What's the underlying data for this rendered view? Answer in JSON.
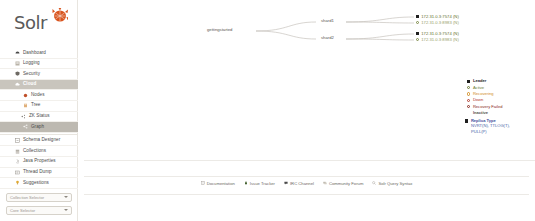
{
  "app": {
    "name": "Solr",
    "logo_text": "Solr",
    "logo_icon": "solr-sunburst-icon"
  },
  "sidebar": {
    "items": [
      {
        "label": "Dashboard",
        "icon": "dashboard-icon",
        "state": "normal",
        "level": 0
      },
      {
        "label": "Logging",
        "icon": "logging-icon",
        "state": "normal",
        "level": 0
      },
      {
        "label": "Security",
        "icon": "security-icon",
        "state": "normal",
        "level": 0
      },
      {
        "label": "Cloud",
        "icon": "cloud-icon",
        "state": "active",
        "level": 0
      },
      {
        "label": "Nodes",
        "icon": "nodes-icon",
        "state": "normal",
        "level": 1
      },
      {
        "label": "Tree",
        "icon": "tree-icon",
        "state": "normal",
        "level": 1
      },
      {
        "label": "ZK Status",
        "icon": "zk-status-icon",
        "state": "normal",
        "level": 1
      },
      {
        "label": "Graph",
        "icon": "graph-icon",
        "state": "selected",
        "level": 1
      },
      {
        "label": "Schema Designer",
        "icon": "schema-designer-icon",
        "state": "normal",
        "level": 0
      },
      {
        "label": "Collections",
        "icon": "collections-icon",
        "state": "normal",
        "level": 0
      },
      {
        "label": "Java Properties",
        "icon": "java-properties-icon",
        "state": "normal",
        "level": 0
      },
      {
        "label": "Thread Dump",
        "icon": "thread-dump-icon",
        "state": "normal",
        "level": 0
      },
      {
        "label": "Suggestions",
        "icon": "suggestions-icon",
        "state": "normal",
        "level": 0
      }
    ],
    "selectors": [
      {
        "label": "Collection Selector",
        "icon": "chevron-down-icon"
      },
      {
        "label": "Core Selector",
        "icon": "chevron-down-icon"
      }
    ]
  },
  "graph": {
    "collection": "gettingstarted",
    "shards": [
      {
        "label": "shard1"
      },
      {
        "label": "shard2"
      }
    ],
    "replicas": [
      {
        "host": "172.31.0.3:7574 (N)",
        "marker": "leader",
        "color": "#5f6f2e",
        "shard": "shard1"
      },
      {
        "host": "172.31.0.3:8983 (N)",
        "marker": "active",
        "color": "#8b9657",
        "shard": "shard1"
      },
      {
        "host": "172.31.0.3:7574 (N)",
        "marker": "leader",
        "color": "#5f6f2e",
        "shard": "shard2"
      },
      {
        "host": "172.31.0.3:8983 (N)",
        "marker": "active",
        "color": "#8b9657",
        "shard": "shard2"
      }
    ]
  },
  "legend": {
    "title": "status-legend",
    "entries": [
      {
        "label": "Leader",
        "marker": "square-filled",
        "color": "#1f1f1f",
        "bold": true
      },
      {
        "label": "Active",
        "marker": "circle",
        "color": "#6b7a33"
      },
      {
        "label": "Recovering",
        "marker": "circle",
        "color": "#d08b1e"
      },
      {
        "label": "Down",
        "marker": "circle",
        "color": "#b03a2e"
      },
      {
        "label": "Recovery Failed",
        "marker": "circle",
        "color": "#8a2b22"
      },
      {
        "label": "Inactive",
        "marker": "none",
        "color": "#55514c",
        "bold": true
      }
    ],
    "replica_type": {
      "title": "Replica Type",
      "marker": "square-filled",
      "types": "NVRT(N), TTLOG(T),",
      "types2": "PULL(P)"
    }
  },
  "footer": {
    "links": [
      {
        "label": "Documentation",
        "icon": "book-icon"
      },
      {
        "label": "Issue Tracker",
        "icon": "bug-icon"
      },
      {
        "label": "IRC Channel",
        "icon": "chat-icon"
      },
      {
        "label": "Community Forum",
        "icon": "forum-icon"
      },
      {
        "label": "Solr Query Syntax",
        "icon": "query-icon"
      }
    ]
  },
  "colors": {
    "accent": "#d9541e",
    "active_bg": "#c9c5bd",
    "selected_bg": "#bdb9b1",
    "edge": "#b9b5ad",
    "leader": "#5f6f2e"
  }
}
